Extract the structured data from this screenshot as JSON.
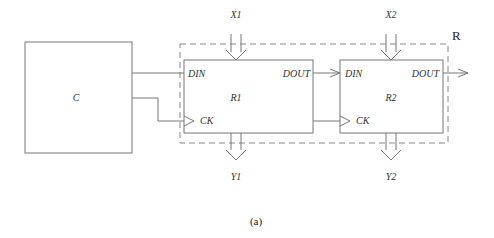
{
  "diagram": {
    "blocks": {
      "controller": {
        "label": "C"
      },
      "register1": {
        "label": "R1",
        "din": "DIN",
        "dout": "DOUT",
        "ck": "CK"
      },
      "register2": {
        "label": "R2",
        "din": "DIN",
        "dout": "DOUT",
        "ck": "CK"
      },
      "group": {
        "label": "R"
      }
    },
    "inputs": {
      "x1": "X1",
      "x2": "X2"
    },
    "outputs": {
      "y1": "Y1",
      "y2": "Y2"
    },
    "caption": "(a)"
  }
}
